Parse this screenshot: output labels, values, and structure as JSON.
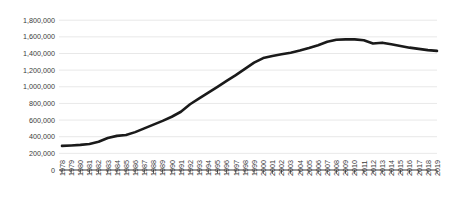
{
  "chart_data": {
    "type": "line",
    "title": "",
    "subtitle": "",
    "xlabel": "",
    "ylabel": "",
    "grid": true,
    "legend": false,
    "legend_position": "none",
    "line_color": "#1a1a1a",
    "grid_color": "#d9d9d9",
    "axis_color": "#3b3b3b",
    "background_color": "#ffffff",
    "ylim": [
      0,
      1800000
    ],
    "ytick_labels": [
      "1,800,000",
      "1,600,000",
      "1,400,000",
      "1,200,000",
      "1,000,000",
      "800,000",
      "600,000",
      "400,000",
      "200,000",
      "0"
    ],
    "ytick_values": [
      1800000,
      1600000,
      1400000,
      1200000,
      1000000,
      800000,
      600000,
      400000,
      200000,
      0
    ],
    "categories": [
      "1978",
      "1979",
      "1980",
      "1981",
      "1982",
      "1983",
      "1984",
      "1985",
      "1986",
      "1987",
      "1988",
      "1989",
      "1990",
      "1991",
      "1992",
      "1993",
      "1994",
      "1995",
      "1996",
      "1997",
      "1998",
      "1999",
      "2000",
      "2001",
      "2002",
      "2003",
      "2004",
      "2005",
      "2006",
      "2007",
      "2008",
      "2009",
      "2010",
      "2011",
      "2012",
      "2013",
      "2014",
      "2015",
      "2016",
      "2017",
      "2018",
      "2019"
    ],
    "values": [
      290000,
      295000,
      302000,
      312000,
      340000,
      385000,
      410000,
      420000,
      455000,
      500000,
      545000,
      590000,
      640000,
      700000,
      790000,
      860000,
      930000,
      1000000,
      1070000,
      1140000,
      1215000,
      1290000,
      1345000,
      1370000,
      1390000,
      1410000,
      1435000,
      1465000,
      1500000,
      1540000,
      1565000,
      1570000,
      1570000,
      1560000,
      1520000,
      1530000,
      1510000,
      1490000,
      1470000,
      1455000,
      1440000,
      1432000
    ]
  }
}
